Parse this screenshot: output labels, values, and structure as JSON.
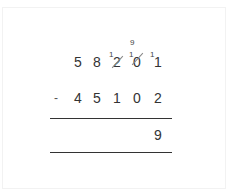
{
  "problem": {
    "operation": "subtraction",
    "minuend": {
      "digits": [
        "5",
        "8",
        "2",
        "0",
        "1"
      ],
      "carries": [
        "",
        "",
        "1",
        "1",
        "1"
      ],
      "struck": [
        false,
        false,
        true,
        true,
        false
      ],
      "borrow_annotation": {
        "column": 3,
        "value": "9"
      }
    },
    "operator": "-",
    "subtrahend": {
      "digits": [
        "4",
        "5",
        "1",
        "0",
        "2"
      ]
    },
    "result": {
      "digits": [
        "",
        "",
        "",
        "",
        "9"
      ]
    }
  },
  "colors": {
    "text": "#333333",
    "rule": "#333333",
    "strike": "#888888"
  }
}
